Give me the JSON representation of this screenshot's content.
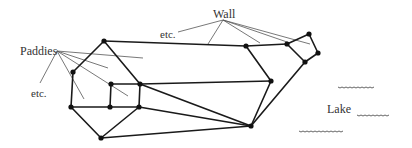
{
  "labels": {
    "paddies": "Paddies",
    "paddies_etc": "etc.",
    "wall": "Wall",
    "wall_etc": "etc.",
    "lake": "Lake"
  },
  "graph": {
    "nodes": [
      {
        "id": "A",
        "x": 104,
        "y": 41
      },
      {
        "id": "B",
        "x": 73,
        "y": 72
      },
      {
        "id": "C",
        "x": 71,
        "y": 107
      },
      {
        "id": "D",
        "x": 101,
        "y": 138
      },
      {
        "id": "E",
        "x": 111,
        "y": 84
      },
      {
        "id": "F",
        "x": 140,
        "y": 84
      },
      {
        "id": "G",
        "x": 110,
        "y": 107
      },
      {
        "id": "H",
        "x": 139,
        "y": 107
      },
      {
        "id": "I",
        "x": 246,
        "y": 46
      },
      {
        "id": "J",
        "x": 271,
        "y": 81
      },
      {
        "id": "K",
        "x": 251,
        "y": 126
      },
      {
        "id": "L",
        "x": 287,
        "y": 44
      },
      {
        "id": "M",
        "x": 309,
        "y": 34
      },
      {
        "id": "N",
        "x": 318,
        "y": 53
      },
      {
        "id": "O",
        "x": 305,
        "y": 62
      }
    ],
    "edges": [
      [
        "A",
        "B"
      ],
      [
        "B",
        "C"
      ],
      [
        "C",
        "D"
      ],
      [
        "D",
        "H"
      ],
      [
        "A",
        "F"
      ],
      [
        "F",
        "H"
      ],
      [
        "E",
        "F"
      ],
      [
        "E",
        "G"
      ],
      [
        "G",
        "H"
      ],
      [
        "C",
        "G"
      ],
      [
        "A",
        "I"
      ],
      [
        "I",
        "L"
      ],
      [
        "I",
        "J"
      ],
      [
        "F",
        "J"
      ],
      [
        "J",
        "K"
      ],
      [
        "F",
        "K"
      ],
      [
        "H",
        "K"
      ],
      [
        "D",
        "K"
      ],
      [
        "K",
        "O"
      ],
      [
        "L",
        "M"
      ],
      [
        "M",
        "N"
      ],
      [
        "N",
        "O"
      ],
      [
        "O",
        "L"
      ]
    ]
  }
}
